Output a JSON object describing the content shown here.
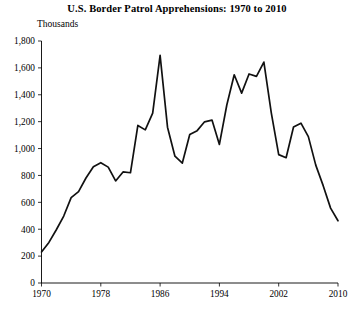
{
  "chart": {
    "title": "U.S. Border Patrol Apprehensions: 1970 to 2010",
    "y_axis_label": "Thousands",
    "x_axis_label": ""
  },
  "chart_data": {
    "type": "line",
    "title": "U.S. Border Patrol Apprehensions: 1970 to 2010",
    "xlabel": "",
    "ylabel": "Thousands",
    "xlim": [
      1970,
      2010
    ],
    "ylim": [
      0,
      1800
    ],
    "grid": false,
    "legend": "none",
    "x_ticks": [
      1970,
      1978,
      1986,
      1994,
      2002,
      2010
    ],
    "x_tick_labels": [
      "1970",
      "1978",
      "1986",
      "1994",
      "2002",
      "2010"
    ],
    "y_ticks": [
      0,
      200,
      400,
      600,
      800,
      1000,
      1200,
      1400,
      1600,
      1800
    ],
    "y_tick_labels": [
      "0",
      "200",
      "400",
      "600",
      "800",
      "1,000",
      "1,200",
      "1,400",
      "1,600",
      "1,800"
    ],
    "x": [
      1970,
      1971,
      1972,
      1973,
      1974,
      1975,
      1976,
      1977,
      1978,
      1979,
      1980,
      1981,
      1982,
      1983,
      1984,
      1985,
      1986,
      1987,
      1988,
      1989,
      1990,
      1991,
      1992,
      1993,
      1994,
      1995,
      1996,
      1997,
      1998,
      1999,
      2000,
      2001,
      2002,
      2003,
      2004,
      2005,
      2006,
      2007,
      2008,
      2009,
      2010
    ],
    "values": [
      231,
      302,
      396,
      498,
      635,
      680,
      781,
      865,
      895,
      862,
      759,
      826,
      820,
      1172,
      1139,
      1263,
      1693,
      1159,
      943,
      892,
      1104,
      1133,
      1199,
      1212,
      1031,
      1324,
      1549,
      1412,
      1555,
      1537,
      1643,
      1266,
      955,
      932,
      1160,
      1189,
      1089,
      877,
      724,
      557,
      463
    ],
    "series": [
      {
        "name": "Apprehensions",
        "color": "#111111",
        "values": [
          231,
          302,
          396,
          498,
          635,
          680,
          781,
          865,
          895,
          862,
          759,
          826,
          820,
          1172,
          1139,
          1263,
          1693,
          1159,
          943,
          892,
          1104,
          1133,
          1199,
          1212,
          1031,
          1324,
          1549,
          1412,
          1555,
          1537,
          1643,
          1266,
          955,
          932,
          1160,
          1189,
          1089,
          877,
          724,
          557,
          463
        ]
      }
    ]
  }
}
